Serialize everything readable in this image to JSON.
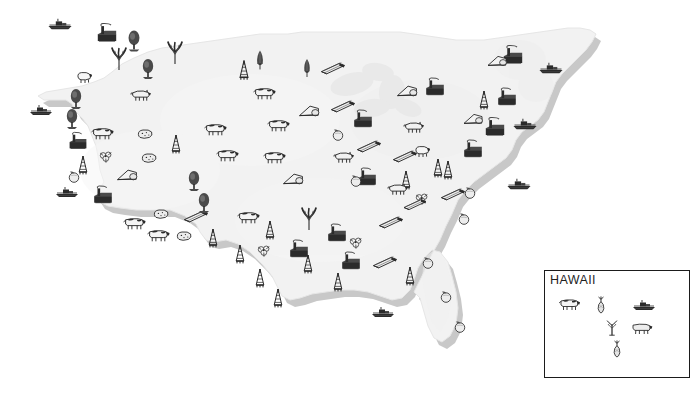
{
  "figure": {
    "kind": "pictorial-resource-map",
    "background_color": "#ffffff",
    "land_fill": "#f2f2f2",
    "land_shadow": "#c8c8c8",
    "land_stroke": "#e2e2e2",
    "lake_fill": "#ececec",
    "icon_ink": "#4a4a4a",
    "icon_ink_dark": "#2b2b2b"
  },
  "insets": [
    {
      "id": "hawaii",
      "label": "HAWAII",
      "border_color": "#1b1b1b",
      "x": 544,
      "y": 270,
      "width": 146,
      "height": 108,
      "icons": [
        {
          "name": "dairy-cattle-icon",
          "x": 12,
          "y": 26,
          "scale": 1.0
        },
        {
          "name": "pineapple-icon",
          "x": 50,
          "y": 24,
          "scale": 0.95
        },
        {
          "name": "cargo-ship-icon",
          "x": 86,
          "y": 28,
          "scale": 1.0
        },
        {
          "name": "sugarcane-icon",
          "x": 60,
          "y": 48,
          "scale": 0.9
        },
        {
          "name": "beef-cattle-icon",
          "x": 84,
          "y": 50,
          "scale": 1.0
        },
        {
          "name": "pineapple-icon",
          "x": 66,
          "y": 68,
          "scale": 0.95
        }
      ]
    }
  ],
  "legend_icon_names": [
    "cargo-ship-icon",
    "factory-icon",
    "conifer-tree-icon",
    "wheat-sheaf-icon",
    "corn-icon",
    "dairy-cattle-icon",
    "beef-cattle-icon",
    "hog-icon",
    "sheep-icon",
    "oil-derrick-icon",
    "lumber-icon",
    "cotton-icon",
    "citrus-icon",
    "potato-icon",
    "pineapple-icon",
    "sugarcane-icon"
  ],
  "map_icons": [
    {
      "name": "cargo-ship-icon",
      "x": 47,
      "y": 18,
      "scale": 1.05
    },
    {
      "name": "factory-icon",
      "x": 96,
      "y": 24,
      "scale": 1.15
    },
    {
      "name": "conifer-tree-icon",
      "x": 126,
      "y": 30,
      "scale": 1.05
    },
    {
      "name": "wheat-sheaf-icon",
      "x": 110,
      "y": 48,
      "scale": 1.1
    },
    {
      "name": "wheat-sheaf-icon",
      "x": 166,
      "y": 42,
      "scale": 1.1
    },
    {
      "name": "conifer-tree-icon",
      "x": 140,
      "y": 58,
      "scale": 1.0
    },
    {
      "name": "sheep-icon",
      "x": 74,
      "y": 70,
      "scale": 1.0
    },
    {
      "name": "conifer-tree-icon",
      "x": 68,
      "y": 88,
      "scale": 1.0
    },
    {
      "name": "hog-icon",
      "x": 129,
      "y": 88,
      "scale": 1.05
    },
    {
      "name": "cargo-ship-icon",
      "x": 28,
      "y": 104,
      "scale": 1.0
    },
    {
      "name": "conifer-tree-icon",
      "x": 64,
      "y": 108,
      "scale": 1.0
    },
    {
      "name": "dairy-cattle-icon",
      "x": 90,
      "y": 126,
      "scale": 1.05
    },
    {
      "name": "factory-icon",
      "x": 67,
      "y": 132,
      "scale": 1.05
    },
    {
      "name": "potato-icon",
      "x": 136,
      "y": 128,
      "scale": 1.0
    },
    {
      "name": "oil-derrick-icon",
      "x": 168,
      "y": 134,
      "scale": 1.0
    },
    {
      "name": "dairy-cattle-icon",
      "x": 203,
      "y": 122,
      "scale": 1.05
    },
    {
      "name": "dairy-cattle-icon",
      "x": 266,
      "y": 118,
      "scale": 1.05
    },
    {
      "name": "oil-derrick-icon",
      "x": 75,
      "y": 155,
      "scale": 1.0
    },
    {
      "name": "cotton-icon",
      "x": 98,
      "y": 150,
      "scale": 0.95
    },
    {
      "name": "potato-icon",
      "x": 140,
      "y": 152,
      "scale": 1.0
    },
    {
      "name": "dairy-cattle-icon",
      "x": 215,
      "y": 148,
      "scale": 1.05
    },
    {
      "name": "dairy-cattle-icon",
      "x": 262,
      "y": 150,
      "scale": 1.05
    },
    {
      "name": "tent-icon",
      "x": 116,
      "y": 168,
      "scale": 1.05
    },
    {
      "name": "factory-icon",
      "x": 92,
      "y": 186,
      "scale": 1.1
    },
    {
      "name": "cargo-ship-icon",
      "x": 54,
      "y": 186,
      "scale": 1.0
    },
    {
      "name": "citrus-icon",
      "x": 66,
      "y": 170,
      "scale": 0.95
    },
    {
      "name": "conifer-tree-icon",
      "x": 186,
      "y": 170,
      "scale": 1.0
    },
    {
      "name": "tent-icon",
      "x": 282,
      "y": 172,
      "scale": 1.05
    },
    {
      "name": "dairy-cattle-icon",
      "x": 122,
      "y": 216,
      "scale": 1.05
    },
    {
      "name": "potato-icon",
      "x": 152,
      "y": 208,
      "scale": 1.0
    },
    {
      "name": "lumber-icon",
      "x": 183,
      "y": 210,
      "scale": 1.05
    },
    {
      "name": "conifer-tree-icon",
      "x": 196,
      "y": 192,
      "scale": 1.0
    },
    {
      "name": "dairy-cattle-icon",
      "x": 146,
      "y": 228,
      "scale": 1.05
    },
    {
      "name": "potato-icon",
      "x": 175,
      "y": 230,
      "scale": 1.0
    },
    {
      "name": "oil-derrick-icon",
      "x": 205,
      "y": 228,
      "scale": 1.0
    },
    {
      "name": "dairy-cattle-icon",
      "x": 236,
      "y": 210,
      "scale": 1.05
    },
    {
      "name": "oil-derrick-icon",
      "x": 262,
      "y": 220,
      "scale": 1.0
    },
    {
      "name": "wheat-sheaf-icon",
      "x": 300,
      "y": 208,
      "scale": 1.1
    },
    {
      "name": "oil-derrick-icon",
      "x": 232,
      "y": 244,
      "scale": 1.0
    },
    {
      "name": "cotton-icon",
      "x": 256,
      "y": 244,
      "scale": 0.95
    },
    {
      "name": "factory-icon",
      "x": 288,
      "y": 240,
      "scale": 1.1
    },
    {
      "name": "oil-derrick-icon",
      "x": 252,
      "y": 268,
      "scale": 1.0
    },
    {
      "name": "oil-derrick-icon",
      "x": 300,
      "y": 254,
      "scale": 1.0
    },
    {
      "name": "factory-icon",
      "x": 326,
      "y": 224,
      "scale": 1.1
    },
    {
      "name": "lumber-icon",
      "x": 378,
      "y": 216,
      "scale": 1.05
    },
    {
      "name": "cotton-icon",
      "x": 348,
      "y": 236,
      "scale": 0.95
    },
    {
      "name": "factory-icon",
      "x": 340,
      "y": 252,
      "scale": 1.1
    },
    {
      "name": "lumber-icon",
      "x": 372,
      "y": 256,
      "scale": 1.05
    },
    {
      "name": "oil-derrick-icon",
      "x": 330,
      "y": 272,
      "scale": 1.0
    },
    {
      "name": "oil-derrick-icon",
      "x": 270,
      "y": 288,
      "scale": 1.0
    },
    {
      "name": "cargo-ship-icon",
      "x": 370,
      "y": 306,
      "scale": 1.0
    },
    {
      "name": "oil-derrick-icon",
      "x": 236,
      "y": 60,
      "scale": 1.05
    },
    {
      "name": "corn-icon",
      "x": 255,
      "y": 50,
      "scale": 1.05
    },
    {
      "name": "dairy-cattle-icon",
      "x": 252,
      "y": 86,
      "scale": 1.05
    },
    {
      "name": "corn-icon",
      "x": 302,
      "y": 58,
      "scale": 1.0
    },
    {
      "name": "lumber-icon",
      "x": 320,
      "y": 62,
      "scale": 1.05
    },
    {
      "name": "tent-icon",
      "x": 298,
      "y": 104,
      "scale": 1.05
    },
    {
      "name": "lumber-icon",
      "x": 330,
      "y": 100,
      "scale": 1.05
    },
    {
      "name": "citrus-icon",
      "x": 330,
      "y": 128,
      "scale": 0.95
    },
    {
      "name": "lumber-icon",
      "x": 356,
      "y": 140,
      "scale": 1.05
    },
    {
      "name": "hog-icon",
      "x": 332,
      "y": 150,
      "scale": 1.05
    },
    {
      "name": "factory-icon",
      "x": 352,
      "y": 110,
      "scale": 1.1
    },
    {
      "name": "factory-icon",
      "x": 356,
      "y": 168,
      "scale": 1.1
    },
    {
      "name": "citrus-icon",
      "x": 348,
      "y": 174,
      "scale": 0.95
    },
    {
      "name": "lumber-icon",
      "x": 392,
      "y": 150,
      "scale": 1.05
    },
    {
      "name": "hog-icon",
      "x": 402,
      "y": 120,
      "scale": 1.05
    },
    {
      "name": "oil-derrick-icon",
      "x": 398,
      "y": 170,
      "scale": 1.0
    },
    {
      "name": "oil-derrick-icon",
      "x": 430,
      "y": 158,
      "scale": 1.0
    },
    {
      "name": "sheep-icon",
      "x": 412,
      "y": 144,
      "scale": 1.0
    },
    {
      "name": "factory-icon",
      "x": 424,
      "y": 78,
      "scale": 1.1
    },
    {
      "name": "tent-icon",
      "x": 396,
      "y": 84,
      "scale": 1.05
    },
    {
      "name": "oil-derrick-icon",
      "x": 476,
      "y": 90,
      "scale": 1.0
    },
    {
      "name": "factory-icon",
      "x": 502,
      "y": 46,
      "scale": 1.15
    },
    {
      "name": "tent-icon",
      "x": 486,
      "y": 54,
      "scale": 1.0
    },
    {
      "name": "cargo-ship-icon",
      "x": 538,
      "y": 62,
      "scale": 1.05
    },
    {
      "name": "factory-icon",
      "x": 496,
      "y": 88,
      "scale": 1.1
    },
    {
      "name": "factory-icon",
      "x": 484,
      "y": 118,
      "scale": 1.15
    },
    {
      "name": "tent-icon",
      "x": 462,
      "y": 112,
      "scale": 1.0
    },
    {
      "name": "factory-icon",
      "x": 462,
      "y": 140,
      "scale": 1.1
    },
    {
      "name": "oil-derrick-icon",
      "x": 440,
      "y": 160,
      "scale": 1.0
    },
    {
      "name": "cargo-ship-icon",
      "x": 512,
      "y": 118,
      "scale": 1.05
    },
    {
      "name": "cargo-ship-icon",
      "x": 506,
      "y": 178,
      "scale": 1.05
    },
    {
      "name": "lumber-icon",
      "x": 440,
      "y": 188,
      "scale": 1.05
    },
    {
      "name": "citrus-icon",
      "x": 462,
      "y": 186,
      "scale": 0.95
    },
    {
      "name": "cotton-icon",
      "x": 414,
      "y": 192,
      "scale": 0.95
    },
    {
      "name": "citrus-icon",
      "x": 456,
      "y": 212,
      "scale": 0.95
    },
    {
      "name": "citrus-icon",
      "x": 420,
      "y": 256,
      "scale": 0.95
    },
    {
      "name": "citrus-icon",
      "x": 438,
      "y": 290,
      "scale": 0.95
    },
    {
      "name": "citrus-icon",
      "x": 452,
      "y": 320,
      "scale": 0.95
    },
    {
      "name": "oil-derrick-icon",
      "x": 402,
      "y": 266,
      "scale": 1.0
    },
    {
      "name": "hog-icon",
      "x": 386,
      "y": 182,
      "scale": 1.05
    },
    {
      "name": "lumber-icon",
      "x": 402,
      "y": 198,
      "scale": 1.0
    }
  ]
}
